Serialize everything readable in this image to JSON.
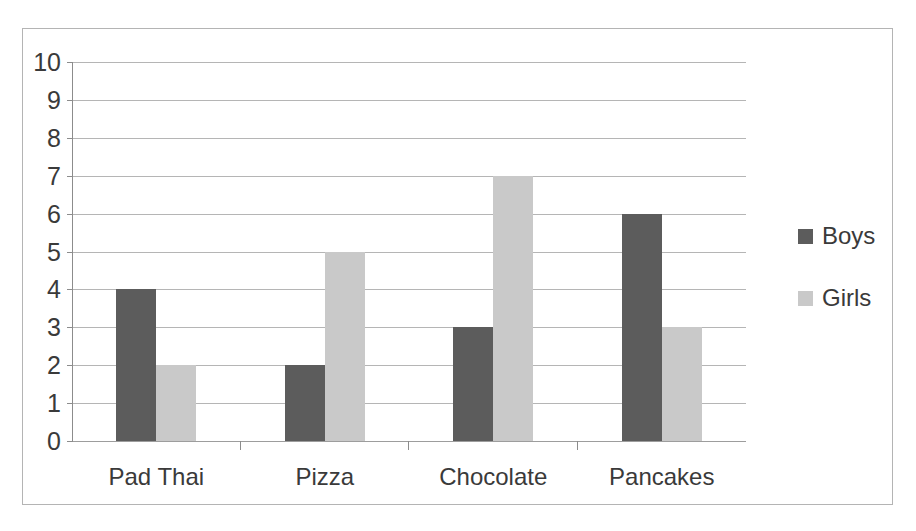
{
  "chart_data": {
    "type": "bar",
    "title": "",
    "subtitle": "",
    "xlabel": "",
    "ylabel": "",
    "categories": [
      "Pad Thai",
      "Pizza",
      "Chocolate",
      "Pancakes"
    ],
    "series": [
      {
        "name": "Boys",
        "color": "#5c5c5c",
        "values": [
          4,
          2,
          3,
          6
        ]
      },
      {
        "name": "Girls",
        "color": "#c9c9c9",
        "values": [
          2,
          5,
          7,
          3
        ]
      }
    ],
    "ylim": [
      0,
      10
    ],
    "ytick_step": 1,
    "ytick_labels": [
      "10",
      "9",
      "8",
      "7",
      "6",
      "5",
      "4",
      "3",
      "2",
      "1",
      "0"
    ],
    "grid": true,
    "grid_axis": "y",
    "legend_position": "right",
    "orientation": "vertical",
    "grouping": "clustered"
  },
  "legend": {
    "items": [
      {
        "label": "Boys",
        "swatch": "boys-swatch"
      },
      {
        "label": "Girls",
        "swatch": "girls-swatch"
      }
    ]
  },
  "colors": {
    "boys": "#5c5c5c",
    "girls": "#c9c9c9",
    "grid": "#a8a8a8",
    "axis": "#8c8c8c",
    "frame": "#b4b4b4",
    "text": "#3a3a3a",
    "background": "#ffffff"
  }
}
